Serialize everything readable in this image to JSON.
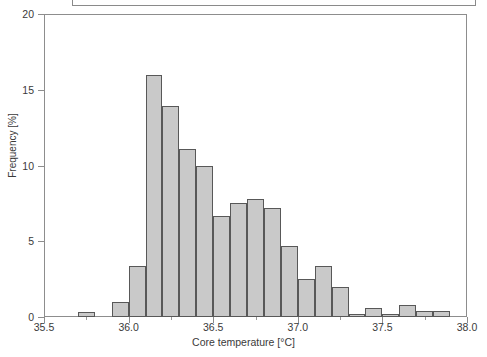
{
  "window": {
    "title_box": {
      "visible_text": "",
      "note": "bordered box clipped off the top edge of the screenshot"
    }
  },
  "axes": {
    "y": {
      "title": "Frequency [%]",
      "ticks": [
        0,
        5,
        10,
        15,
        20
      ],
      "tick_labels": [
        "0",
        "5",
        "10",
        "15",
        "20"
      ],
      "min": 0,
      "max": 20
    },
    "x": {
      "title": "Core temperature [°C]",
      "ticks": [
        35.5,
        36.0,
        36.5,
        37.0,
        37.5,
        38.0
      ],
      "tick_labels": [
        "35.5",
        "36.0",
        "36.5",
        "37.0",
        "37.5",
        "38.0"
      ],
      "min": 35.5,
      "max": 38.0
    }
  },
  "style": {
    "bar_fill": "#c9c9c9",
    "bar_edge": "#585858",
    "frame_color": "#8d8d8d",
    "text_color": "#3a3a3a",
    "background": "#ffffff"
  },
  "chart_data": {
    "type": "bar",
    "title": "",
    "xlabel": "Core temperature [°C]",
    "ylabel": "Frequency [%]",
    "xlim": [
      35.5,
      38.0
    ],
    "ylim": [
      0,
      20
    ],
    "grid": false,
    "legend": null,
    "bin_width": 0.1,
    "bin_starts": [
      35.7,
      35.9,
      36.0,
      36.1,
      36.2,
      36.3,
      36.4,
      36.5,
      36.6,
      36.7,
      36.8,
      36.9,
      37.0,
      37.1,
      37.2,
      37.3,
      37.4,
      37.5,
      37.6,
      37.7,
      37.8
    ],
    "categories": [
      "35.7",
      "35.9",
      "36.0",
      "36.1",
      "36.2",
      "36.3",
      "36.4",
      "36.5",
      "36.6",
      "36.7",
      "36.8",
      "36.9",
      "37.0",
      "37.1",
      "37.2",
      "37.3",
      "37.4",
      "37.5",
      "37.6",
      "37.7",
      "37.8"
    ],
    "values": [
      0.3,
      1.0,
      3.4,
      16.0,
      13.9,
      11.1,
      10.0,
      6.7,
      7.5,
      7.8,
      7.2,
      4.7,
      2.5,
      3.4,
      2.0,
      0.2,
      0.6,
      0.2,
      0.8,
      0.4,
      0.4
    ]
  }
}
